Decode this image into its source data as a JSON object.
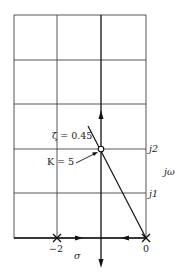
{
  "diagram": {
    "type": "root-locus",
    "labels": {
      "zeta": "ζ = 0.45",
      "gain": "K = 5",
      "j2": "j2",
      "j1": "j1",
      "jomega": "jω",
      "sigma": "σ",
      "minus2": "−2",
      "zero": "0"
    },
    "poles": [
      {
        "sigma": -2,
        "omega": 0,
        "marker": "x"
      },
      {
        "sigma": 0,
        "omega": 0,
        "marker": "x"
      }
    ],
    "operating_point": {
      "zeta": 0.45,
      "K": 5,
      "omega": 2,
      "marker": "circle"
    },
    "colors": {
      "line": "#222222",
      "grid": "#333333",
      "background": "#ffffff"
    }
  }
}
